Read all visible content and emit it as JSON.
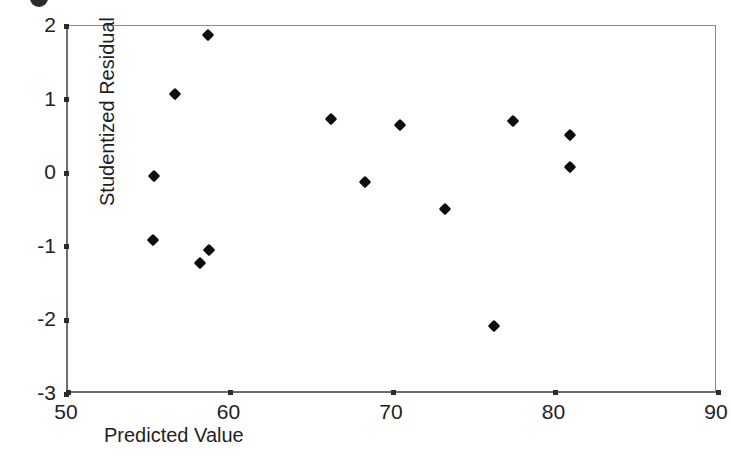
{
  "chart_data": {
    "type": "scatter",
    "title": "",
    "xlabel": "Predicted Value",
    "ylabel": "Studentized Residual",
    "xlim": [
      50,
      90
    ],
    "ylim": [
      -3,
      2
    ],
    "xticks": [
      "50",
      "60",
      "70",
      "80",
      "90"
    ],
    "yticks": [
      "2",
      "1",
      "0",
      "-1",
      "-2",
      "-3"
    ],
    "grid": false,
    "legend": null,
    "marker": "diamond",
    "marker_color": "#0d0d0d",
    "points": [
      {
        "x": 58.6,
        "y": 1.88
      },
      {
        "x": 56.6,
        "y": 1.07
      },
      {
        "x": 55.3,
        "y": -0.04
      },
      {
        "x": 55.2,
        "y": -0.91
      },
      {
        "x": 58.7,
        "y": -1.05
      },
      {
        "x": 58.1,
        "y": -1.22
      },
      {
        "x": 66.2,
        "y": 0.73
      },
      {
        "x": 70.4,
        "y": 0.65
      },
      {
        "x": 68.3,
        "y": -0.12
      },
      {
        "x": 73.2,
        "y": -0.49
      },
      {
        "x": 76.2,
        "y": -2.08
      },
      {
        "x": 77.4,
        "y": 0.71
      },
      {
        "x": 80.9,
        "y": 0.52
      },
      {
        "x": 80.9,
        "y": 0.08
      }
    ]
  },
  "axis_color": "#6e6e6e",
  "background": "#ffffff"
}
